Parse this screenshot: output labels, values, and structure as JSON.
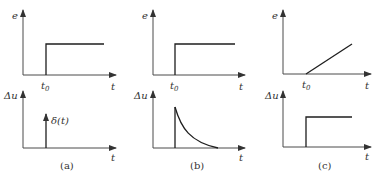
{
  "figure": {
    "panels": [
      {
        "id": "a",
        "caption": "(a)",
        "top_plot": {
          "y_label": "e",
          "x_label": "t",
          "marker": "t",
          "marker_sub": "0",
          "signal": "step"
        },
        "bottom_plot": {
          "y_label": "Δu",
          "x_label": "t",
          "signal": "impulse",
          "annotation": "δ(t)"
        }
      },
      {
        "id": "b",
        "caption": "(b)",
        "top_plot": {
          "y_label": "e",
          "x_label": "t",
          "marker": "t",
          "marker_sub": "0",
          "signal": "step"
        },
        "bottom_plot": {
          "y_label": "Δu",
          "x_label": "t",
          "signal": "exponential-decay"
        }
      },
      {
        "id": "c",
        "caption": "(c)",
        "top_plot": {
          "y_label": "e",
          "x_label": "t",
          "marker": "t",
          "marker_sub": "0",
          "signal": "ramp"
        },
        "bottom_plot": {
          "y_label": "Δu",
          "x_label": "t",
          "signal": "step"
        }
      }
    ]
  }
}
